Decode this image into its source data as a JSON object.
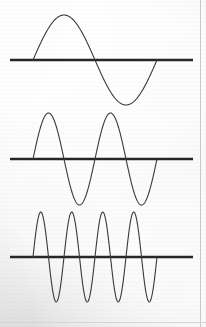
{
  "figure": {
    "title": "Three sine waveforms of increasing frequency",
    "background_color": "#f1f1f0",
    "ink_color": "#3a3a3a",
    "axis_color": "#262626",
    "border_color": "#c9c9c9",
    "width": 206,
    "height": 327
  },
  "border": {
    "right_rule_label": "page-edge-rule",
    "right_rule_x": 200,
    "bottom_rule_label": "page-bottom-rule",
    "bottom_rule_y": 322
  },
  "panels": [
    {
      "name": "waveform-panel-1",
      "label": "1 cycle",
      "cycles": 1,
      "axis": {
        "x1": 10,
        "x2": 193,
        "y": 60,
        "thickness": 2.6
      },
      "wave": {
        "x_start": 33,
        "x_end": 157,
        "baseline_y": 60,
        "amplitude": 45,
        "peak_y": 15,
        "trough_y": 105,
        "stroke_width": 1.1,
        "phase": "positive-first"
      }
    },
    {
      "name": "waveform-panel-2",
      "label": "2 cycles",
      "cycles": 2,
      "axis": {
        "x1": 10,
        "x2": 193,
        "y": 159,
        "thickness": 2.6
      },
      "wave": {
        "x_start": 33,
        "x_end": 157,
        "baseline_y": 159,
        "amplitude": 46,
        "peak_y": 113,
        "trough_y": 205,
        "stroke_width": 1.1,
        "phase": "positive-first"
      }
    },
    {
      "name": "waveform-panel-3",
      "label": "4 cycles",
      "cycles": 4,
      "axis": {
        "x1": 10,
        "x2": 193,
        "y": 257,
        "thickness": 2.6
      },
      "wave": {
        "x_start": 33,
        "x_end": 157,
        "baseline_y": 257,
        "amplitude": 45,
        "peak_y": 212,
        "trough_y": 302,
        "stroke_width": 1.1,
        "phase": "positive-first"
      }
    }
  ],
  "chart_data": {
    "type": "line",
    "title": "Three sine waveforms of increasing frequency",
    "xlabel": "",
    "ylabel": "",
    "grid": false,
    "legend": "none",
    "xlim": [
      0,
      1
    ],
    "ylim": [
      -1,
      1
    ],
    "series": [
      {
        "name": "sine-1-cycle",
        "frequency_cycles": 1,
        "amplitude": 1,
        "phase_deg": 0,
        "x": [
          0,
          0.125,
          0.25,
          0.375,
          0.5,
          0.625,
          0.75,
          0.875,
          1
        ],
        "values": [
          0,
          0.707,
          1,
          0.707,
          0,
          -0.707,
          -1,
          -0.707,
          0
        ]
      },
      {
        "name": "sine-2-cycles",
        "frequency_cycles": 2,
        "amplitude": 1,
        "phase_deg": 0,
        "x": [
          0,
          0.0625,
          0.125,
          0.1875,
          0.25,
          0.3125,
          0.375,
          0.4375,
          0.5,
          0.5625,
          0.625,
          0.6875,
          0.75,
          0.8125,
          0.875,
          0.9375,
          1
        ],
        "values": [
          0,
          0.707,
          1,
          0.707,
          0,
          -0.707,
          -1,
          -0.707,
          0,
          0.707,
          1,
          0.707,
          0,
          -0.707,
          -1,
          -0.707,
          0
        ]
      },
      {
        "name": "sine-4-cycles",
        "frequency_cycles": 4,
        "amplitude": 1,
        "phase_deg": 0,
        "x": [
          0,
          0.03125,
          0.0625,
          0.09375,
          0.125,
          0.15625,
          0.1875,
          0.21875,
          0.25,
          0.28125,
          0.3125,
          0.34375,
          0.375,
          0.40625,
          0.4375,
          0.46875,
          0.5,
          0.53125,
          0.5625,
          0.59375,
          0.625,
          0.65625,
          0.6875,
          0.71875,
          0.75,
          0.78125,
          0.8125,
          0.84375,
          0.875,
          0.90625,
          0.9375,
          0.96875,
          1
        ],
        "values": [
          0,
          0.707,
          1,
          0.707,
          0,
          -0.707,
          -1,
          -0.707,
          0,
          0.707,
          1,
          0.707,
          0,
          -0.707,
          -1,
          -0.707,
          0,
          0.707,
          1,
          0.707,
          0,
          -0.707,
          -1,
          -0.707,
          0,
          0.707,
          1,
          0.707,
          0,
          -0.707,
          -1,
          -0.707,
          0
        ]
      }
    ]
  }
}
